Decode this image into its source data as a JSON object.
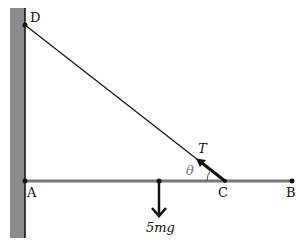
{
  "diagram": {
    "points": {
      "D": {
        "label": "D",
        "x": 25,
        "y": 25
      },
      "A": {
        "label": "A",
        "x": 25,
        "y": 181
      },
      "C": {
        "label": "C",
        "x": 225,
        "y": 181
      },
      "B": {
        "label": "B",
        "x": 292,
        "y": 181
      }
    },
    "labels": {
      "tension": "T",
      "angle": "θ",
      "weight": "5mg"
    },
    "colors": {
      "wall": "#8c8c8c",
      "rod": "#777777",
      "string": "#111111",
      "arrow": "#111111"
    }
  }
}
